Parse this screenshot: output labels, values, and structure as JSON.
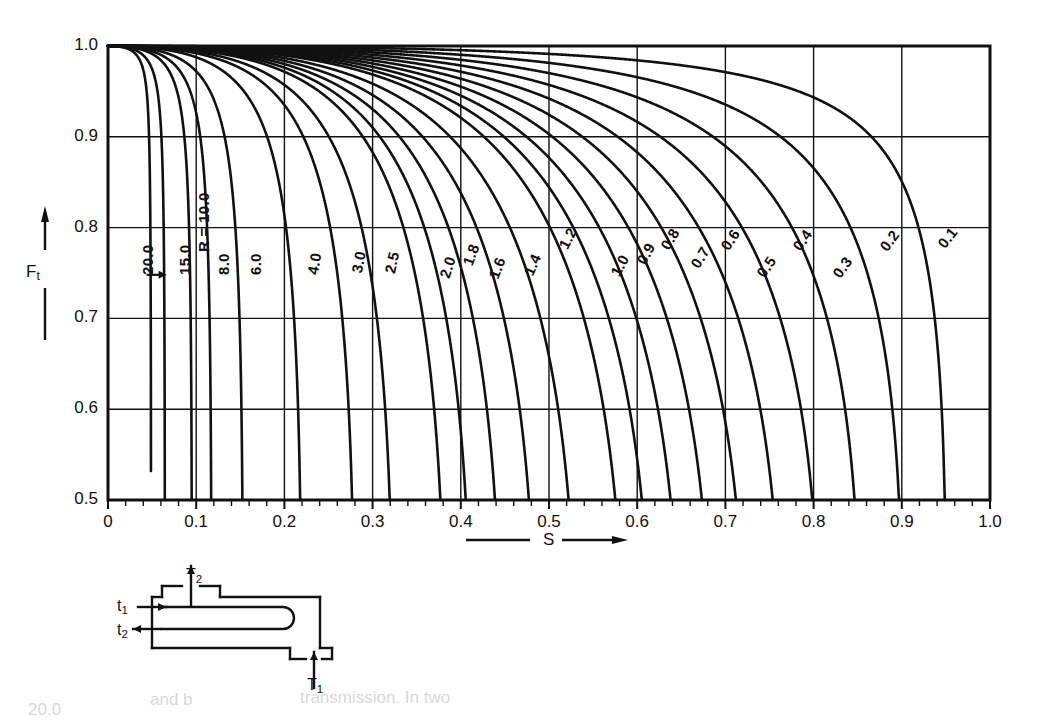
{
  "figure": {
    "kind": "lmtd-correction-factor-chart",
    "axis_x_label": "S",
    "axis_y_label": "F",
    "axis_y_label_sub": "t"
  },
  "chart_data": {
    "type": "line",
    "title": "",
    "xlabel": "S",
    "ylabel": "Ft",
    "xlim": [
      0,
      1.0
    ],
    "ylim": [
      0.5,
      1.0
    ],
    "grid": true,
    "legend": "inline curve labels",
    "x_ticks": [
      "0",
      "0.1",
      "0.2",
      "0.3",
      "0.4",
      "0.5",
      "0.6",
      "0.7",
      "0.8",
      "0.9",
      "1.0"
    ],
    "x_tick_values": [
      0,
      0.1,
      0.2,
      0.3,
      0.4,
      0.5,
      0.6,
      0.7,
      0.8,
      0.9,
      1.0
    ],
    "y_ticks": [
      "0.5",
      "0.6",
      "0.7",
      "0.8",
      "0.9",
      "1.0"
    ],
    "y_tick_values": [
      0.5,
      0.6,
      0.7,
      0.8,
      0.9,
      1.0
    ],
    "x_minor_tick_step": 0.02,
    "series_parameter_name": "R",
    "series": [
      {
        "name": "20.0",
        "R": 20.0,
        "label": "20.0",
        "label_x": 0.035,
        "label_y": 0.748,
        "label_angle": -90
      },
      {
        "name": "15.0",
        "R": 15.0,
        "label": "15.0",
        "label_x": 0.077,
        "label_y": 0.748,
        "label_angle": -90
      },
      {
        "name": "10.0",
        "R": 10.0,
        "label": "R = 10.0",
        "label_x": 0.099,
        "label_y": 0.773,
        "label_angle": -90
      },
      {
        "name": "8.0",
        "R": 8.0,
        "label": "8.0",
        "label_x": 0.121,
        "label_y": 0.748,
        "label_angle": -90
      },
      {
        "name": "6.0",
        "R": 6.0,
        "label": "6.0",
        "label_x": 0.158,
        "label_y": 0.748,
        "label_angle": -90
      },
      {
        "name": "4.0",
        "R": 4.0,
        "label": "4.0",
        "label_x": 0.222,
        "label_y": 0.75,
        "label_angle": -81
      },
      {
        "name": "3.0",
        "R": 3.0,
        "label": "3.0",
        "label_x": 0.272,
        "label_y": 0.752,
        "label_angle": -79
      },
      {
        "name": "2.5",
        "R": 2.5,
        "label": "2.5",
        "label_x": 0.309,
        "label_y": 0.752,
        "label_angle": -77
      },
      {
        "name": "2.0",
        "R": 2.0,
        "label": "2.0",
        "label_x": 0.372,
        "label_y": 0.748,
        "label_angle": -72
      },
      {
        "name": "1.8",
        "R": 1.8,
        "label": "1.8",
        "label_x": 0.398,
        "label_y": 0.762,
        "label_angle": -70
      },
      {
        "name": "1.6",
        "R": 1.6,
        "label": "1.6",
        "label_x": 0.428,
        "label_y": 0.748,
        "label_angle": -69
      },
      {
        "name": "1.4",
        "R": 1.4,
        "label": "1.4",
        "label_x": 0.467,
        "label_y": 0.752,
        "label_angle": -66
      },
      {
        "name": "1.2",
        "R": 1.2,
        "label": "1.2",
        "label_x": 0.507,
        "label_y": 0.782,
        "label_angle": -63
      },
      {
        "name": "1.0",
        "R": 1.0,
        "label": "1.0",
        "label_x": 0.566,
        "label_y": 0.752,
        "label_angle": -62
      },
      {
        "name": "0.9",
        "R": 0.9,
        "label": "0.9",
        "label_x": 0.595,
        "label_y": 0.765,
        "label_angle": -61
      },
      {
        "name": "0.8",
        "R": 0.8,
        "label": "0.8",
        "label_x": 0.622,
        "label_y": 0.782,
        "label_angle": -60
      },
      {
        "name": "0.7",
        "R": 0.7,
        "label": "0.7",
        "label_x": 0.657,
        "label_y": 0.762,
        "label_angle": -58
      },
      {
        "name": "0.6",
        "R": 0.6,
        "label": "0.6",
        "label_x": 0.69,
        "label_y": 0.782,
        "label_angle": -57
      },
      {
        "name": "0.5",
        "R": 0.5,
        "label": "0.5",
        "label_x": 0.731,
        "label_y": 0.752,
        "label_angle": -56
      },
      {
        "name": "0.4",
        "R": 0.4,
        "label": "0.4",
        "label_x": 0.772,
        "label_y": 0.782,
        "label_angle": -55
      },
      {
        "name": "0.3",
        "R": 0.3,
        "label": "0.3",
        "label_x": 0.818,
        "label_y": 0.752,
        "label_angle": -54
      },
      {
        "name": "0.2",
        "R": 0.2,
        "label": "0.2",
        "label_x": 0.871,
        "label_y": 0.782,
        "label_angle": -53
      },
      {
        "name": "0.1",
        "R": 0.1,
        "label": "0.1",
        "label_x": 0.937,
        "label_y": 0.785,
        "label_angle": -52
      }
    ],
    "annotations": [
      {
        "name": "r20-pointer-arrow",
        "text": "",
        "x": 0.054,
        "y": 0.748
      }
    ]
  },
  "diagram": {
    "name": "1-2 shell-and-tube heat exchanger",
    "labels": {
      "shell_outlet": "T",
      "shell_outlet_sub": "2",
      "tube_inlet": "t",
      "tube_inlet_sub": "1",
      "tube_outlet": "t",
      "tube_outlet_sub": "2",
      "shell_inlet": "T",
      "shell_inlet_sub": "1"
    }
  },
  "scan_bleed": [
    {
      "text": "20.0",
      "x": 28,
      "y": 700
    },
    {
      "text": "and b",
      "x": 150,
      "y": 690
    },
    {
      "text": "transmission. In two",
      "x": 300,
      "y": 688
    }
  ]
}
